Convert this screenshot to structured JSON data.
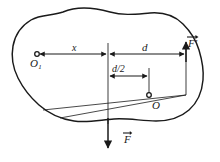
{
  "figure": {
    "type": "physics-free-body-diagram",
    "background_color": "#ffffff",
    "stroke_color": "#1a1a1a",
    "labels": {
      "point_o1": "O",
      "point_o1_subscript": "1",
      "distance_x": "x",
      "distance_d": "d",
      "distance_d_half": "d/2",
      "point_o": "O",
      "force_f_prime": "F'",
      "force_f": "F"
    },
    "elements": {
      "body_outline_name": "rigid-body-outline",
      "pivot_marker_o1": "small-circle-marker",
      "pivot_marker_o": "small-circle-marker"
    }
  }
}
